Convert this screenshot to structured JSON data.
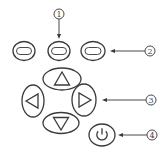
{
  "diagram": {
    "type": "keypad-callout",
    "colors": {
      "line": "#3a3a3a",
      "background": "#ffffff"
    },
    "buttons": [
      {
        "id": "left-oval",
        "icon": "dash-slot-icon",
        "cx": 24,
        "cy": 51,
        "rx": 11,
        "ry": 9.5
      },
      {
        "id": "center-oval",
        "icon": "dash-slot-icon",
        "cx": 59,
        "cy": 51,
        "rx": 11,
        "ry": 9.5
      },
      {
        "id": "right-oval",
        "icon": "dash-slot-icon",
        "cx": 93,
        "cy": 51,
        "rx": 12,
        "ry": 9.5
      },
      {
        "id": "up",
        "icon": "triangle-up-icon",
        "cx": 62,
        "cy": 79,
        "rx": 19,
        "ry": 11
      },
      {
        "id": "left",
        "icon": "triangle-left-icon",
        "cx": 33,
        "cy": 101,
        "rx": 11,
        "ry": 16
      },
      {
        "id": "right",
        "icon": "triangle-right-icon",
        "cx": 84,
        "cy": 100,
        "rx": 12,
        "ry": 16
      },
      {
        "id": "down",
        "icon": "triangle-down-icon",
        "cx": 61,
        "cy": 123,
        "rx": 18,
        "ry": 10.5
      },
      {
        "id": "power",
        "icon": "power-icon",
        "cx": 102,
        "cy": 135,
        "rx": 13,
        "ry": 11
      }
    ],
    "callouts": [
      {
        "label": "①",
        "number": 1,
        "target": "center-oval",
        "x": 59,
        "y": 14,
        "direction": "down"
      },
      {
        "label": "②",
        "number": 2,
        "target": "right-oval",
        "x": 150,
        "y": 51,
        "direction": "left"
      },
      {
        "label": "③",
        "number": 3,
        "target": "right",
        "x": 151,
        "y": 100,
        "direction": "left"
      },
      {
        "label": "④",
        "number": 4,
        "target": "power",
        "x": 152,
        "y": 135,
        "direction": "left"
      }
    ]
  }
}
